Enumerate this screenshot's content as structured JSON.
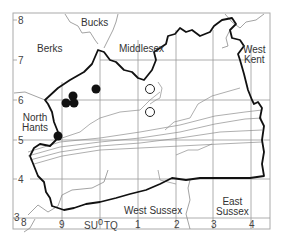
{
  "map": {
    "grid_x_labels": [
      {
        "text": "8",
        "x": 16
      },
      {
        "text": "9",
        "x": 60
      },
      {
        "text": "SU",
        "x": 84
      },
      {
        "text": "0",
        "x": 98
      },
      {
        "text": "TQ",
        "x": 104
      },
      {
        "text": "1",
        "x": 136
      },
      {
        "text": "2",
        "x": 174
      },
      {
        "text": "3",
        "x": 211
      },
      {
        "text": "4",
        "x": 249
      }
    ],
    "grid_y_labels": [
      {
        "text": "8",
        "y": 16
      },
      {
        "text": "7",
        "y": 56
      },
      {
        "text": "6",
        "y": 96
      },
      {
        "text": "5",
        "y": 136
      },
      {
        "text": "4",
        "y": 175
      },
      {
        "text": "3",
        "y": 213
      }
    ],
    "regions": [
      {
        "name": "Bucks",
        "line1": "Bucks",
        "line2": "",
        "x": 81,
        "y": 18
      },
      {
        "name": "Berks",
        "line1": "Berks",
        "line2": "",
        "x": 37,
        "y": 44
      },
      {
        "name": "Middlesex",
        "line1": "Middlesex",
        "line2": "",
        "x": 118,
        "y": 44
      },
      {
        "name": "West Kent",
        "line1": "West",
        "line2": "Kent",
        "x": 240,
        "y": 45
      },
      {
        "name": "North Hants",
        "line1": "North",
        "line2": "Hants",
        "x": 22,
        "y": 113
      },
      {
        "name": "West Sussex",
        "line1": "West Sussex",
        "line2": "",
        "x": 124,
        "y": 206
      },
      {
        "name": "East Sussex",
        "line1": "East",
        "line2": "Sussex",
        "x": 215,
        "y": 197
      }
    ],
    "records_filled": [
      {
        "x": 66,
        "y": 103
      },
      {
        "x": 73,
        "y": 96
      },
      {
        "x": 74,
        "y": 103
      },
      {
        "x": 96,
        "y": 89
      },
      {
        "x": 58,
        "y": 136
      }
    ],
    "records_open": [
      {
        "x": 150,
        "y": 89
      },
      {
        "x": 150,
        "y": 112
      }
    ],
    "colors": {
      "border": "#111111",
      "grid": "#9a9a9a",
      "contour": "#8c8c8c",
      "text": "#333333"
    }
  }
}
